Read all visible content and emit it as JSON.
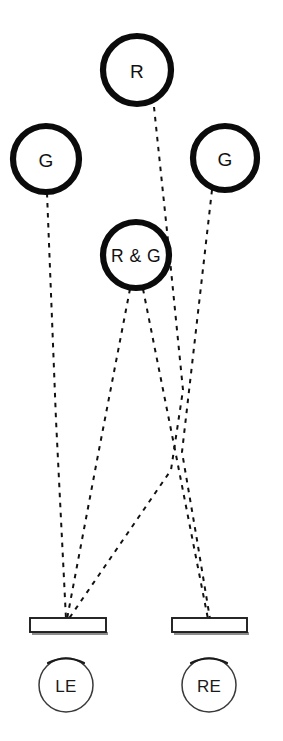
{
  "figure": {
    "kind": "binocular-stimulus-diagram",
    "background_color": "#ffffff",
    "stroke_color": "#111111",
    "width": 283,
    "height": 741
  },
  "stimuli": [
    {
      "id": "stim-red-top",
      "label": "R",
      "name": "stimulus-circle-r",
      "cx": 137,
      "cy": 70,
      "r": 34,
      "stroke_width": 6.2
    },
    {
      "id": "stim-green-left",
      "label": "G",
      "name": "stimulus-circle-g-left",
      "cx": 46,
      "cy": 159,
      "r": 33,
      "stroke_width": 6.2
    },
    {
      "id": "stim-green-right",
      "label": "G",
      "name": "stimulus-circle-g-right",
      "cx": 225,
      "cy": 158,
      "r": 32,
      "stroke_width": 6.2
    },
    {
      "id": "stim-red-and-green",
      "label": "R & G",
      "name": "stimulus-circle-r-and-g",
      "cx": 136,
      "cy": 255,
      "r": 33,
      "stroke_width": 6.2
    }
  ],
  "bars": [
    {
      "id": "bar-left",
      "name": "aperture-bar-left",
      "x": 30,
      "y": 618,
      "width": 76,
      "height": 14
    },
    {
      "id": "bar-right",
      "name": "aperture-bar-right",
      "x": 172,
      "y": 618,
      "width": 75,
      "height": 14
    }
  ],
  "eyes": [
    {
      "id": "eye-left",
      "label": "LE",
      "name": "eye-circle-left",
      "cx": 66,
      "cy": 685,
      "r": 27
    },
    {
      "id": "eye-right",
      "label": "RE",
      "name": "eye-circle-right",
      "cx": 209,
      "cy": 685,
      "r": 27
    }
  ],
  "rays": [
    {
      "id": "ray-g-left-to-le",
      "name": "ray-g-left-to-left-eye",
      "from": "stim-green-left",
      "to": "bar-left",
      "path": "M 47 193 L 56 420 L 66 619"
    },
    {
      "id": "ray-rg-to-le",
      "name": "ray-r-and-g-to-left-eye",
      "from": "stim-red-and-green",
      "to": "bar-left",
      "path": "M 130 289 L 98 455 L 67 619"
    },
    {
      "id": "ray-rg-to-re",
      "name": "ray-r-and-g-to-right-eye",
      "from": "stim-red-and-green",
      "to": "bar-right",
      "path": "M 143 289 L 176 455 L 208 619"
    },
    {
      "id": "ray-r-to-le",
      "name": "ray-r-to-left-eye",
      "from": "stim-red-top",
      "to": "bar-left",
      "path": "M 154 107 L 169 250 L 183 390 L 171 470 L 68 620"
    },
    {
      "id": "ray-g-right-to-re",
      "name": "ray-g-right-to-right-eye",
      "from": "stim-green-right",
      "to": "bar-right",
      "path": "M 212 190 L 196 330 L 182 452 L 197 540 L 210 619"
    }
  ],
  "legend": {
    "r_meaning": "R",
    "g_meaning": "G",
    "combined_meaning": "R & G",
    "left_eye": "LE",
    "right_eye": "RE"
  }
}
